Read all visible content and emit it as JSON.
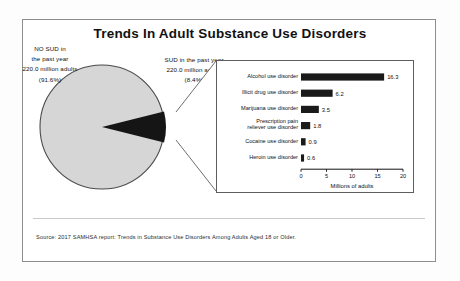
{
  "title": "Trends In Adult Substance Use Disorders",
  "source": "Source: 2017 SAMHSA report: Trends in Substance Use Disorders Among Adults Aged 18 or Older.",
  "pie": {
    "no_sud": {
      "line1": "NO SUD in",
      "line2": "the past year",
      "line3": "220.0 million adults",
      "line4": "(91.6%)"
    },
    "sud": {
      "line1": "SUD in the past year",
      "line2": "220.0 million adults",
      "line3": "(8.4%)"
    }
  },
  "chart_data": {
    "type": "bar",
    "orientation": "horizontal",
    "title": "",
    "xlabel": "Millions of adults",
    "ylabel": "",
    "xlim": [
      0,
      20
    ],
    "xticks": [
      0,
      5,
      10,
      15,
      20
    ],
    "grid": false,
    "categories": [
      "Alcohol use disorder",
      "Illicit drug use disorder",
      "Marijuana use disorder",
      "Prescription pain reliever use disorder",
      "Cocaine use disorder",
      "Heroin use disorder"
    ],
    "values": [
      16.3,
      6.2,
      3.5,
      1.8,
      0.9,
      0.6
    ],
    "bar_color": "#1a1a1a",
    "pie_slices": [
      {
        "name": "NO SUD in the past year",
        "percent": 91.6,
        "color": "#d4d4d4"
      },
      {
        "name": "SUD in the past year",
        "percent": 8.4,
        "color": "#1a1a1a"
      }
    ]
  }
}
